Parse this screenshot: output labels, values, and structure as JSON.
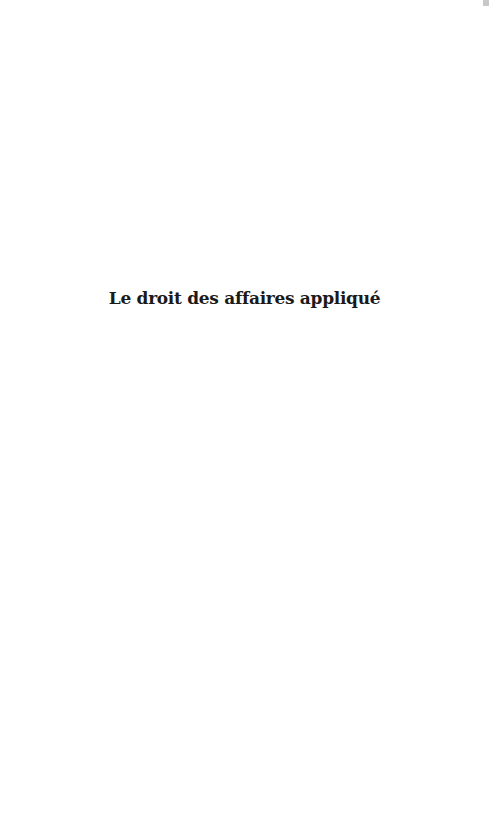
{
  "document": {
    "title": "Le droit des affaires appliqué"
  },
  "colors": {
    "background": "#ffffff",
    "text": "#1a1a1a",
    "scrollbar_thumb": "#c8c8c8"
  }
}
